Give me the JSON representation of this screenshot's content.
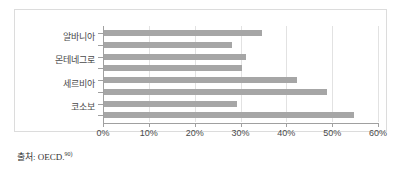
{
  "chart_data": {
    "type": "bar",
    "orientation": "horizontal",
    "title": "",
    "xlabel": "",
    "ylabel": "",
    "categories": [
      "알바니아",
      "몬테네그로",
      "세르비아",
      "코소보"
    ],
    "series": [
      {
        "name": "series-1",
        "values": [
          34.5,
          31.0,
          42.0,
          29.0
        ]
      },
      {
        "name": "series-2",
        "values": [
          28.0,
          30.0,
          48.7,
          54.5
        ]
      }
    ],
    "xlim": [
      0,
      60
    ],
    "xticks": [
      0,
      10,
      20,
      30,
      40,
      50,
      60
    ],
    "xtick_labels": [
      "0%",
      "10%",
      "20%",
      "30%",
      "40%",
      "50%",
      "60%"
    ],
    "grid": true,
    "grid_axis": "x",
    "legend": false,
    "bar_color": "#a6a6a6"
  },
  "footer": {
    "source_prefix": "출처: OECD.",
    "source_footnote": "90)"
  }
}
